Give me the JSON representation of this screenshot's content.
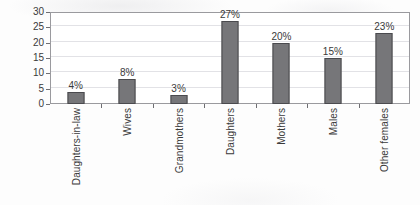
{
  "chart_data": {
    "type": "bar",
    "title": "",
    "subtitle": "",
    "xlabel": "",
    "ylabel": "Percentage",
    "ylim": [
      0,
      30
    ],
    "yticks": [
      0,
      5,
      10,
      15,
      20,
      25,
      30
    ],
    "ytick_labels": [
      "0",
      "5",
      "10",
      "15",
      "20",
      "25",
      "30"
    ],
    "grid": true,
    "legend": false,
    "legend_position": "none",
    "bar_color": "#767679",
    "bar_edge_color": "#4a4a4e",
    "categories": [
      "Daughters-in-law",
      "Wives",
      "Grandmothers",
      "Daughters",
      "Mothers",
      "Males",
      "Other females"
    ],
    "values": [
      4,
      8,
      3,
      27,
      20,
      15,
      23
    ],
    "data_labels": [
      "4%",
      "8%",
      "3%",
      "27%",
      "20%",
      "15%",
      "23%"
    ]
  }
}
